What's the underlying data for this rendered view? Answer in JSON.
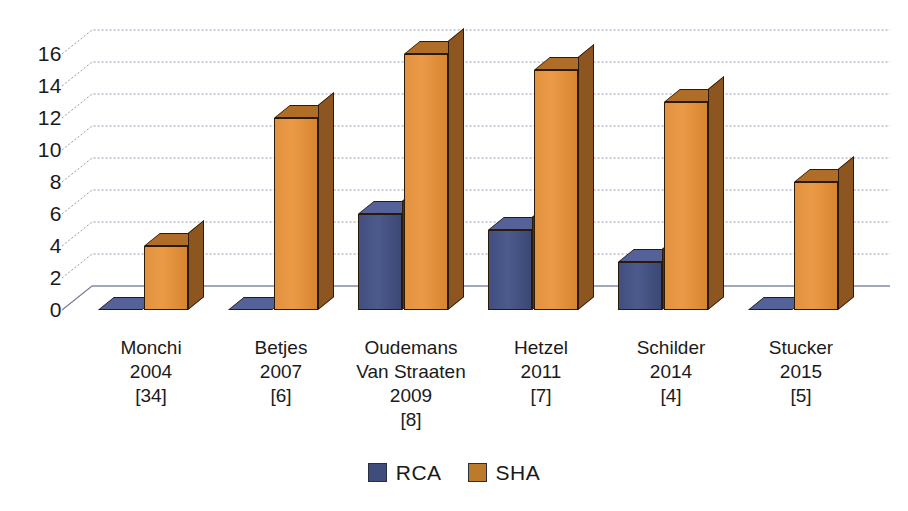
{
  "chart_data": {
    "type": "bar",
    "title": "",
    "subtitle": "",
    "xlabel": "",
    "ylabel": "",
    "ylim": [
      0,
      16
    ],
    "ytick_step": 2,
    "yticks": [
      16,
      14,
      12,
      10,
      8,
      6,
      4,
      2,
      0
    ],
    "grid": true,
    "grid_style": "dotted-horizontal-3d",
    "legend_position": "bottom-center",
    "style": "3d-grouped-column",
    "categories": [
      "Monchi\n2004\n[34]",
      "Betjes\n2007\n[6]",
      "Oudemans\nVan Straaten\n2009\n[8]",
      "Hetzel\n2011\n[7]",
      "Schilder\n2014\n[4]",
      "Stucker\n2015\n[5]"
    ],
    "category_lines": [
      [
        "Monchi",
        "2004",
        "[34]"
      ],
      [
        "Betjes",
        "2007",
        "[6]"
      ],
      [
        "Oudemans",
        "Van Straaten",
        "2009",
        "[8]"
      ],
      [
        "Hetzel",
        "2011",
        "[7]"
      ],
      [
        "Schilder",
        "2014",
        "[4]"
      ],
      [
        "Stucker",
        "2015",
        "[5]"
      ]
    ],
    "series": [
      {
        "name": "RCA",
        "color": "#3f4d7d",
        "values": [
          0,
          0,
          6,
          5,
          3,
          0
        ]
      },
      {
        "name": "SHA",
        "color": "#e2913f",
        "values": [
          4,
          12,
          16,
          15,
          13,
          8
        ]
      }
    ]
  },
  "legend": {
    "items": [
      {
        "label": "RCA",
        "swatch": "rca"
      },
      {
        "label": "SHA",
        "swatch": "sha"
      }
    ]
  }
}
